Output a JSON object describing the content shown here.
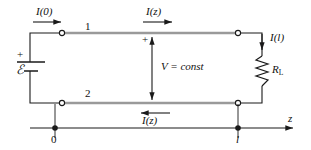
{
  "figure": {
    "type": "circuit-diagram",
    "background_color": "#ffffff",
    "conductor_color": "#999999",
    "wire_color": "#1a1a1a"
  },
  "labels": {
    "current_input": "I(0)",
    "current_top": "I(z)",
    "current_bottom": "I(z)",
    "current_load": "I(l)",
    "conductor_1": "1",
    "conductor_2": "2",
    "voltage": "V = const",
    "voltage_polarity": "+",
    "source_polarity": "+",
    "source_emf": "ℰ",
    "load_resistor": "R",
    "load_resistor_sub": "L",
    "axis_origin": "0",
    "axis_length": "l",
    "axis_name": "z"
  },
  "geometry": {
    "top_conductor_y": 33,
    "bottom_conductor_y": 103,
    "left_terminal_x": 62,
    "right_terminal_x": 238,
    "axis_y": 128,
    "axis_start_x": 30,
    "axis_end_x": 295,
    "origin_x": 55,
    "length_mark_x": 238
  }
}
